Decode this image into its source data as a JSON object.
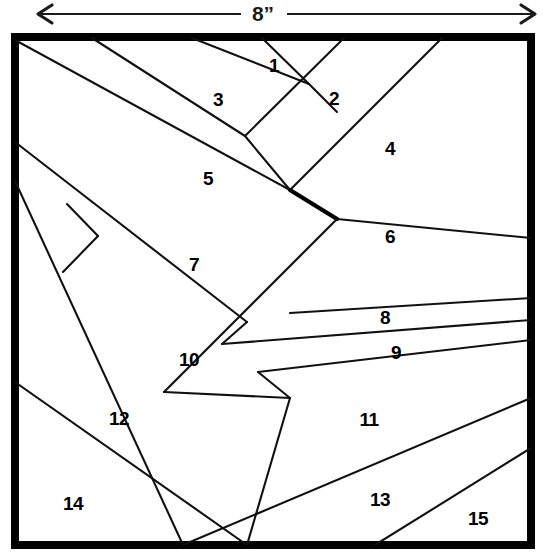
{
  "figure": {
    "type": "quilt-block-piecing-diagram",
    "title": "",
    "dimension": {
      "label": "8”",
      "orientation": "horizontal",
      "position": "top",
      "arrow_left_x": 38,
      "arrow_right_x": 535,
      "arrow_y": 14
    },
    "block": {
      "shape": "square",
      "border_color": "#000000",
      "fill_color": "#ffffff",
      "left": 15,
      "top": 37,
      "right": 531,
      "bottom": 545,
      "pattern": "chevron string-pieced strips"
    },
    "line_color": "#111111",
    "piece_count": 15,
    "pieces": [
      {
        "number": "1",
        "label_x": 274,
        "label_y": 67
      },
      {
        "number": "2",
        "label_x": 334,
        "label_y": 100
      },
      {
        "number": "3",
        "label_x": 218,
        "label_y": 101
      },
      {
        "number": "4",
        "label_x": 390,
        "label_y": 150
      },
      {
        "number": "5",
        "label_x": 208,
        "label_y": 180
      },
      {
        "number": "6",
        "label_x": 390,
        "label_y": 238
      },
      {
        "number": "7",
        "label_x": 194,
        "label_y": 266
      },
      {
        "number": "8",
        "label_x": 385,
        "label_y": 319
      },
      {
        "number": "9",
        "label_x": 396,
        "label_y": 354
      },
      {
        "number": "10",
        "label_x": 189,
        "label_y": 361
      },
      {
        "number": "11",
        "label_x": 369,
        "label_y": 421
      },
      {
        "number": "12",
        "label_x": 119,
        "label_y": 420
      },
      {
        "number": "13",
        "label_x": 380,
        "label_y": 501
      },
      {
        "number": "14",
        "label_x": 73,
        "label_y": 505
      },
      {
        "number": "15",
        "label_x": 478,
        "label_y": 520
      }
    ]
  }
}
